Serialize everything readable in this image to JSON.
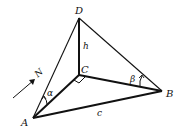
{
  "diagram": {
    "points": {
      "A": {
        "label": "A",
        "x": 33,
        "y": 118
      },
      "B": {
        "label": "B",
        "x": 162,
        "y": 91
      },
      "C": {
        "label": "C",
        "x": 79,
        "y": 75
      },
      "D": {
        "label": "D",
        "x": 79,
        "y": 18
      }
    },
    "edge_labels": {
      "h": "h",
      "c": "c"
    },
    "angle_labels": {
      "alpha": "α",
      "beta": "β"
    },
    "north_label": "N",
    "colors": {
      "stroke": "#111111",
      "background": "#ffffff"
    }
  }
}
